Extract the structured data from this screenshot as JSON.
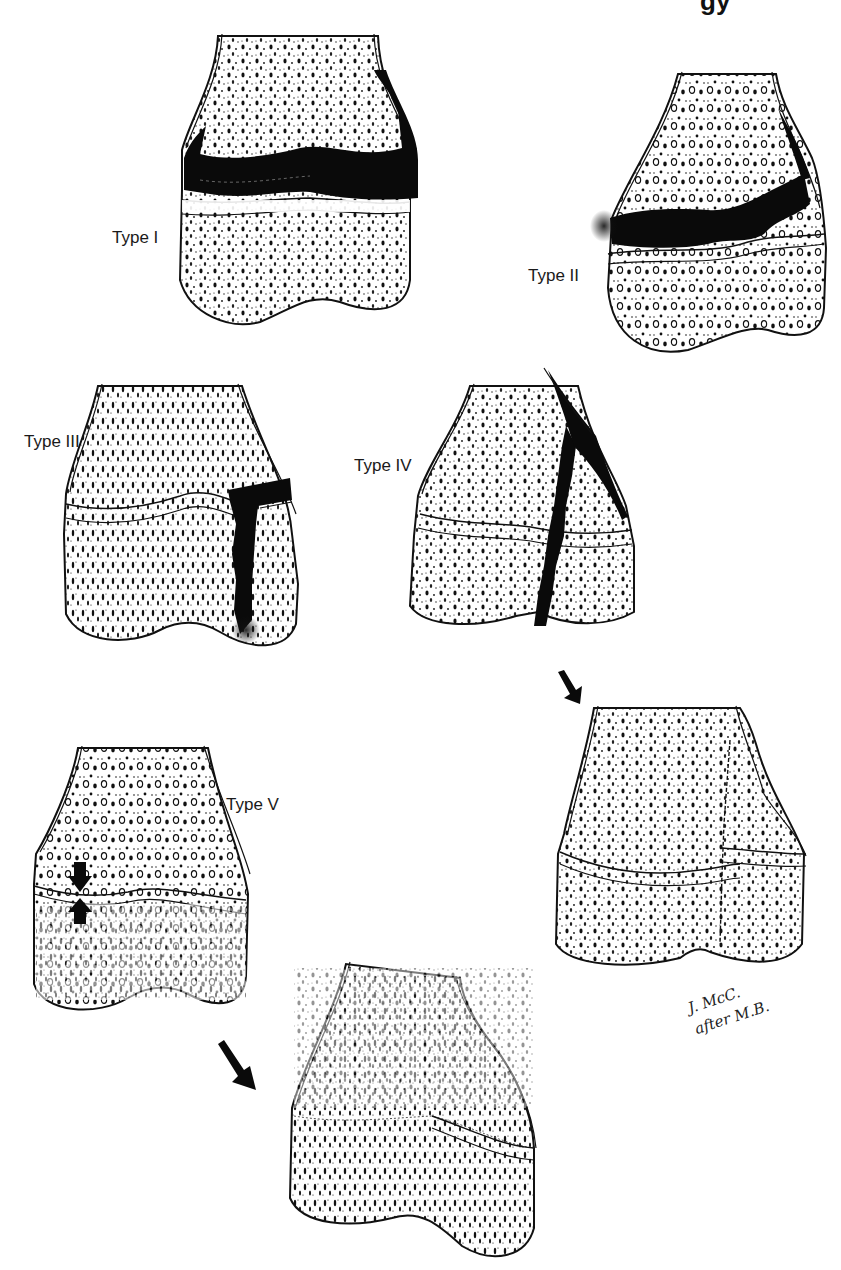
{
  "header": {
    "fragment": "gy"
  },
  "diagram": {
    "panels": [
      {
        "id": "type-1",
        "label": "Type I"
      },
      {
        "id": "type-2",
        "label": "Type II"
      },
      {
        "id": "type-3",
        "label": "Type III"
      },
      {
        "id": "type-4",
        "label": "Type IV"
      },
      {
        "id": "type-4-healed",
        "label": ""
      },
      {
        "id": "type-5",
        "label": "Type V"
      },
      {
        "id": "type-5-healed",
        "label": ""
      }
    ],
    "colors": {
      "ink": "#111111",
      "background": "#ffffff",
      "fracture": "#0a0a0a"
    }
  },
  "signature": {
    "line1": "J. McC.",
    "line2": "after M.B."
  }
}
